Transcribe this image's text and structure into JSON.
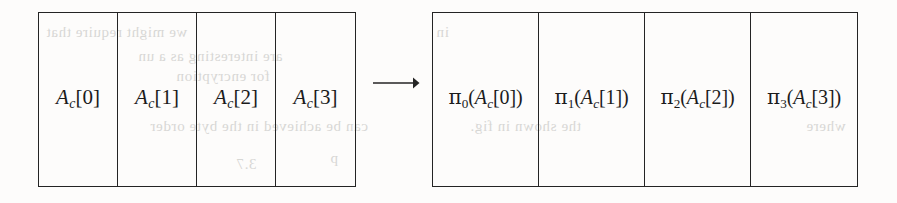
{
  "figure": {
    "kind": "array-transformation-diagram",
    "ink_color": "#242424",
    "paper_color": "#fdfcfb",
    "arrow": {
      "glyph": "longrightarrow",
      "direction": "right",
      "label": "maps to"
    },
    "left_table": {
      "name": "input-array",
      "cells": [
        {
          "text": "A_c[0]",
          "var": "A",
          "subscript": "c",
          "index": "0"
        },
        {
          "text": "A_c[1]",
          "var": "A",
          "subscript": "c",
          "index": "1"
        },
        {
          "text": "A_c[2]",
          "var": "A",
          "subscript": "c",
          "index": "2"
        },
        {
          "text": "A_c[3]",
          "var": "A",
          "subscript": "c",
          "index": "3"
        }
      ]
    },
    "right_table": {
      "name": "output-array",
      "cells": [
        {
          "text": "π0(A_c[0])",
          "pi": "π",
          "pi_subscript": "0",
          "var": "A",
          "subscript": "c",
          "index": "0"
        },
        {
          "text": "π1(A_c[1])",
          "pi": "π",
          "pi_subscript": "1",
          "var": "A",
          "subscript": "c",
          "index": "1"
        },
        {
          "text": "π2(A_c[2])",
          "pi": "π",
          "pi_subscript": "2",
          "var": "A",
          "subscript": "c",
          "index": "2"
        },
        {
          "text": "π3(A_c[3])",
          "pi": "π",
          "pi_subscript": "3",
          "var": "A",
          "subscript": "c",
          "index": "3"
        }
      ]
    },
    "bleed_through": [
      {
        "text": "we might require that",
        "x": 46,
        "y": 24
      },
      {
        "text": "are interesting as a un",
        "x": 138,
        "y": 48
      },
      {
        "text": "for encryption",
        "x": 176,
        "y": 68
      },
      {
        "text": "can be achieved in the byte order",
        "x": 150,
        "y": 118
      },
      {
        "text": "3.7",
        "x": 236,
        "y": 156
      },
      {
        "text": "p",
        "x": 330,
        "y": 150
      },
      {
        "text": "in",
        "x": 436,
        "y": 24
      },
      {
        "text": "the shown in fig.",
        "x": 470,
        "y": 118
      },
      {
        "text": "where",
        "x": 806,
        "y": 118
      }
    ]
  }
}
